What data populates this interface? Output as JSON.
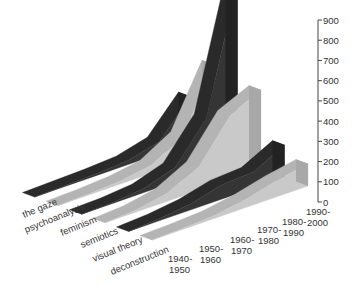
{
  "chart_data": {
    "type": "area",
    "subtype": "3d-ribbon",
    "title": "",
    "xlabel": "",
    "ylabel": "",
    "ylim": [
      0,
      900
    ],
    "yticks": [
      0,
      100,
      200,
      300,
      400,
      500,
      600,
      700,
      800,
      900
    ],
    "ytick_labels": [
      "0",
      "100",
      "200",
      "300",
      "400",
      "500",
      "600",
      "700",
      "800",
      "900"
    ],
    "categories": [
      [
        "1940-",
        "1950"
      ],
      [
        "1950-",
        "1960"
      ],
      [
        "1960-",
        "1970"
      ],
      [
        "1970-",
        "1980"
      ],
      [
        "1980-",
        "1990"
      ],
      [
        "1990-",
        "2000"
      ]
    ],
    "grid": false,
    "legend": "none (series labelled along depth axis)",
    "series": [
      {
        "name": "the gaze",
        "shade": "dark",
        "values": [
          0,
          5,
          10,
          20,
          60,
          230
        ]
      },
      {
        "name": "psychoanalysis",
        "shade": "light",
        "values": [
          0,
          5,
          15,
          40,
          130,
          430
        ]
      },
      {
        "name": "feminism",
        "shade": "dark",
        "values": [
          0,
          5,
          20,
          70,
          260,
          880
        ]
      },
      {
        "name": "semiotics",
        "shade": "light",
        "values": [
          0,
          10,
          40,
          120,
          320,
          390
        ]
      },
      {
        "name": "visual theory",
        "shade": "dark",
        "values": [
          0,
          10,
          30,
          70,
          80,
          160
        ]
      },
      {
        "name": "deconstruction",
        "shade": "light",
        "values": [
          0,
          5,
          15,
          40,
          80,
          110
        ]
      }
    ],
    "colors": {
      "dark": "#353535",
      "dark_top": "#2a2a2a",
      "light": "#b4b4b4",
      "light_front": "#c9c9c9",
      "axis": "#444444",
      "text": "#333333"
    }
  }
}
